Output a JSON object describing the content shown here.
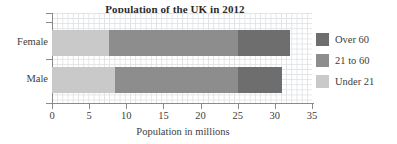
{
  "chart_data": {
    "type": "bar",
    "orientation": "horizontal",
    "stacked": true,
    "title": "Population of the UK in 2012",
    "xlabel": "Population in millions",
    "ylabel": "",
    "categories": [
      "Female",
      "Male"
    ],
    "xlim": [
      0,
      35
    ],
    "xticks": [
      0,
      5,
      10,
      15,
      20,
      25,
      30,
      35
    ],
    "xtick_labels": [
      "0",
      "5",
      "10",
      "15",
      "20",
      "25",
      "30",
      "35"
    ],
    "grid": true,
    "grid_spacing": 1,
    "legend_position": "right",
    "series": [
      {
        "name": "Under 21",
        "color": "#c9c9c9",
        "values": [
          7.7,
          8.5
        ]
      },
      {
        "name": "21 to 60",
        "color": "#8d8d8d",
        "values": [
          17.3,
          16.5
        ]
      },
      {
        "name": "Over 60",
        "color": "#6e6e6e",
        "values": [
          7.0,
          6.0
        ]
      }
    ],
    "totals": [
      32.0,
      31.0
    ]
  },
  "legend": {
    "items": [
      {
        "label": "Over 60",
        "color": "#6e6e6e"
      },
      {
        "label": "21 to 60",
        "color": "#8d8d8d"
      },
      {
        "label": "Under 21",
        "color": "#c9c9c9"
      }
    ]
  },
  "colors": {
    "over_60": "#6e6e6e",
    "21_to_60": "#8d8d8d",
    "under_21": "#c9c9c9",
    "axis": "#8a8a8a",
    "grid": "#dfe3e6",
    "text": "#3d3d3d",
    "title": "#2b2b2b",
    "background": "#ffffff"
  }
}
